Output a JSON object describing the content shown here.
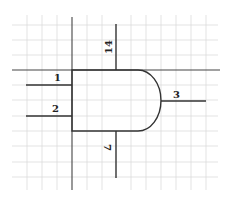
{
  "diagram": {
    "type": "logic-gate-pinout",
    "gate_shape": "AND",
    "colors": {
      "background": "#ffffff",
      "grid": "#dcdcdc",
      "lines": "#333333",
      "text": "#222222"
    },
    "pins": [
      {
        "id": "pin-1",
        "label": "1",
        "role": "input"
      },
      {
        "id": "pin-2",
        "label": "2",
        "role": "input"
      },
      {
        "id": "pin-3",
        "label": "3",
        "role": "output"
      },
      {
        "id": "pin-14",
        "label": "14",
        "role": "power"
      },
      {
        "id": "pin-7",
        "label": "7",
        "role": "ground"
      }
    ]
  }
}
